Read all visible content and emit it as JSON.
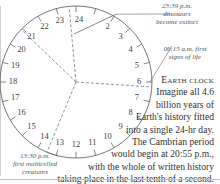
{
  "title": "Earth clock",
  "caption": {
    "title": "Earth clock",
    "lines": [
      "Imagine all 4.6",
      "billion years of",
      "Earth's history fitted",
      "into a single 24-hr day.",
      "The Cambrian period",
      "would begin at 20:55 p.m.,",
      "with the whole of written history",
      "taking place in the last tenth of a second."
    ]
  },
  "clock": {
    "hours": [
      "24",
      "2",
      "3",
      "4",
      "5",
      "6",
      "7",
      "8",
      "9",
      "10",
      "11",
      "12",
      "13",
      "14",
      "15",
      "16",
      "17",
      "18",
      "19",
      "20",
      "21",
      "22",
      "23"
    ],
    "hands_hours": [
      6.25,
      13.5,
      20.92,
      23.65
    ]
  },
  "annotations": {
    "dinosaurs": {
      "time": "23:39 p.m.",
      "line1": "dinosaurs",
      "line2": "become extinct"
    },
    "life": {
      "time": "06:15 a.m. first",
      "line1": "signs of life"
    },
    "multicelled": {
      "time": "13:30 p.m.",
      "line1": "first multicelled",
      "line2": "creatures"
    }
  },
  "colors": {
    "line": "#666666",
    "dash": "#777777",
    "rule": "#bfbfbf"
  }
}
